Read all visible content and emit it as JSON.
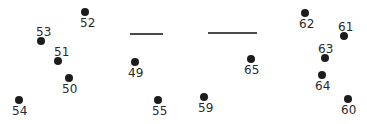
{
  "figure": {
    "width": 367,
    "height": 124,
    "background_color": "#ffffff",
    "marker_color": "#1c1c1c",
    "label_color": "#2a2a2a",
    "segment_color": "#4a4a4a",
    "marker_radius": 4,
    "label_font_size": 12
  },
  "chart_data": {
    "type": "scatter",
    "title": "",
    "xlabel": "",
    "ylabel": "",
    "xlim": [
      0,
      367
    ],
    "ylim": [
      0,
      124
    ],
    "grid": false,
    "legend": null,
    "annotations_are_point_ids": true,
    "points": [
      {
        "id": "54",
        "x": 19,
        "y": 100,
        "label": "54",
        "label_x": 12,
        "label_y": 105,
        "label_position": "below"
      },
      {
        "id": "50",
        "x": 69,
        "y": 78,
        "label": "50",
        "label_x": 62,
        "label_y": 83,
        "label_position": "below"
      },
      {
        "id": "51",
        "x": 58,
        "y": 61,
        "label": "51",
        "label_x": 54,
        "label_y": 46,
        "label_position": "above"
      },
      {
        "id": "53",
        "x": 41,
        "y": 41,
        "label": "53",
        "label_x": 36,
        "label_y": 26,
        "label_position": "above"
      },
      {
        "id": "52",
        "x": 85,
        "y": 12,
        "label": "52",
        "label_x": 80,
        "label_y": 17,
        "label_position": "below"
      },
      {
        "id": "49",
        "x": 135,
        "y": 62,
        "label": "49",
        "label_x": 128,
        "label_y": 67,
        "label_position": "below"
      },
      {
        "id": "55",
        "x": 158,
        "y": 100,
        "label": "55",
        "label_x": 152,
        "label_y": 105,
        "label_position": "below"
      },
      {
        "id": "59",
        "x": 204,
        "y": 97,
        "label": "59",
        "label_x": 198,
        "label_y": 102,
        "label_position": "below"
      },
      {
        "id": "65",
        "x": 251,
        "y": 59,
        "label": "65",
        "label_x": 244,
        "label_y": 64,
        "label_position": "below"
      },
      {
        "id": "62",
        "x": 305,
        "y": 13,
        "label": "62",
        "label_x": 299,
        "label_y": 18,
        "label_position": "below"
      },
      {
        "id": "61",
        "x": 344,
        "y": 36,
        "label": "61",
        "label_x": 338,
        "label_y": 21,
        "label_position": "above"
      },
      {
        "id": "63",
        "x": 325,
        "y": 58,
        "label": "63",
        "label_x": 318,
        "label_y": 43,
        "label_position": "above"
      },
      {
        "id": "64",
        "x": 322,
        "y": 75,
        "label": "64",
        "label_x": 315,
        "label_y": 80,
        "label_position": "below"
      },
      {
        "id": "60",
        "x": 348,
        "y": 99,
        "label": "60",
        "label_x": 341,
        "label_y": 104,
        "label_position": "below"
      }
    ],
    "segments": [
      {
        "id": "segment-1",
        "x1": 130,
        "x2": 163,
        "y": 34,
        "thickness": 2
      },
      {
        "id": "segment-2",
        "x1": 208,
        "x2": 257,
        "y": 33,
        "thickness": 2
      }
    ]
  }
}
